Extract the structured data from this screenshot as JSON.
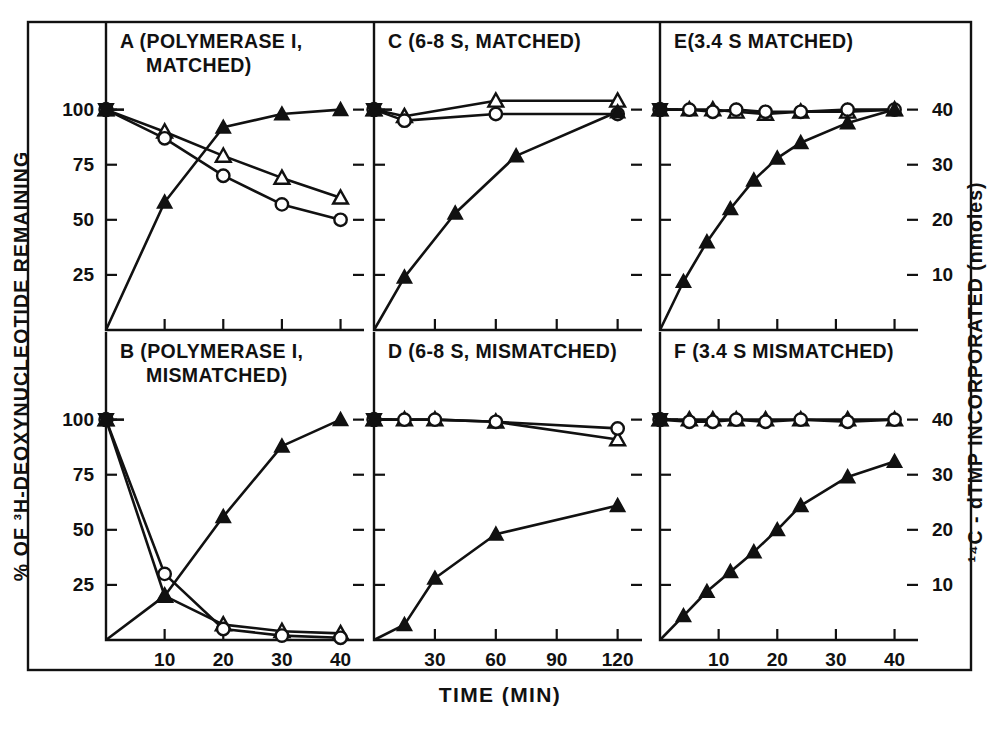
{
  "figure": {
    "xlabel": "TIME (MIN)",
    "ylabel_left": "% OF ³H-DEOXYNUCLEOTIDE REMAINING",
    "ylabel_right": "¹⁴C - dTMP INCORPORATED (nmoles)",
    "left_ticks": [
      "100",
      "75",
      "50",
      "25"
    ],
    "right_ticks": [
      "40",
      "30",
      "20",
      "10"
    ],
    "frame_color": "#111111",
    "background": "#ffffff"
  },
  "panels": [
    {
      "id": "A",
      "label": "A (POLYMERASE I,",
      "label_line2": "MATCHED)",
      "xticks": [
        "10",
        "20",
        "30",
        "40"
      ],
      "xtick_values": [
        10,
        20,
        30,
        40
      ],
      "xlim": [
        0,
        44
      ],
      "ylim_left": [
        0,
        108
      ],
      "row": "top",
      "col": 1
    },
    {
      "id": "B",
      "label": "B (POLYMERASE I,",
      "label_line2": "MISMATCHED)",
      "xticks": [
        "10",
        "20",
        "30",
        "40"
      ],
      "xtick_values": [
        10,
        20,
        30,
        40
      ],
      "xlim": [
        0,
        44
      ],
      "ylim_left": [
        0,
        108
      ],
      "row": "bottom",
      "col": 1
    },
    {
      "id": "C",
      "label": "C (6-8 S, MATCHED)",
      "label_line2": "",
      "xticks": [
        "30",
        "60",
        "90",
        "120"
      ],
      "xtick_values": [
        30,
        60,
        90,
        120
      ],
      "xlim": [
        0,
        132
      ],
      "ylim_left": [
        0,
        108
      ],
      "row": "top",
      "col": 2
    },
    {
      "id": "D",
      "label": "D (6-8 S, MISMATCHED)",
      "label_line2": "",
      "xticks": [
        "30",
        "60",
        "90",
        "120"
      ],
      "xtick_values": [
        30,
        60,
        90,
        120
      ],
      "xlim": [
        0,
        132
      ],
      "ylim_left": [
        0,
        108
      ],
      "row": "bottom",
      "col": 2
    },
    {
      "id": "E",
      "label": "E(3.4 S MATCHED)",
      "label_line2": "",
      "xticks": [
        "10",
        "20",
        "30",
        "40"
      ],
      "xtick_values": [
        10,
        20,
        30,
        40
      ],
      "xlim": [
        0,
        44
      ],
      "ylim_left": [
        0,
        108
      ],
      "row": "top",
      "col": 3
    },
    {
      "id": "F",
      "label": "F (3.4 S MISMATCHED)",
      "label_line2": "",
      "xticks": [
        "10",
        "20",
        "30",
        "40"
      ],
      "xtick_values": [
        10,
        20,
        30,
        40
      ],
      "xlim": [
        0,
        44
      ],
      "ylim_left": [
        0,
        108
      ],
      "row": "bottom",
      "col": 3
    }
  ],
  "chart_data": {
    "type": "line",
    "title": "",
    "xlabel": "TIME (MIN)",
    "ylabel": "% OF ³H-DEOXYNUCLEOTIDE REMAINING",
    "ylabel_secondary": "¹⁴C - dTMP INCORPORATED (nmoles)",
    "grid": false,
    "legend_position": "none",
    "marker_semantics": {
      "open-triangle": "³H-deoxynucleotide remaining (series 1)",
      "open-circle": "³H-deoxynucleotide remaining (series 2)",
      "filled-triangle": "¹⁴C-dTMP incorporated"
    },
    "panels": [
      {
        "id": "A",
        "title": "A (POLYMERASE I, MATCHED)",
        "xlim": [
          0,
          44
        ],
        "ylim_left": [
          0,
          108
        ],
        "ylim_right": [
          0,
          43.2
        ],
        "xticks": [
          10,
          20,
          30,
          40
        ],
        "left_yticks": [
          100,
          75,
          50,
          25
        ],
        "right_yticks": [
          40,
          30,
          20,
          10
        ],
        "series": [
          {
            "name": "open-triangle",
            "axis": "left",
            "x": [
              0,
              10,
              20,
              30,
              40
            ],
            "y": [
              100,
              90,
              79,
              69,
              60
            ]
          },
          {
            "name": "open-circle",
            "axis": "left",
            "x": [
              0,
              10,
              20,
              30,
              40
            ],
            "y": [
              100,
              87,
              70,
              57,
              50
            ]
          },
          {
            "name": "filled-triangle",
            "axis": "right",
            "x": [
              0,
              10,
              20,
              30,
              40
            ],
            "y": [
              0,
              23.2,
              36.8,
              39.2,
              40.0
            ]
          }
        ]
      },
      {
        "id": "B",
        "title": "B (POLYMERASE I, MISMATCHED)",
        "xlim": [
          0,
          44
        ],
        "ylim_left": [
          0,
          108
        ],
        "ylim_right": [
          0,
          43.2
        ],
        "xticks": [
          10,
          20,
          30,
          40
        ],
        "left_yticks": [
          100,
          75,
          50,
          25
        ],
        "right_yticks": [
          40,
          30,
          20,
          10
        ],
        "series": [
          {
            "name": "open-triangle",
            "axis": "left",
            "x": [
              0,
              10,
              20,
              30,
              40
            ],
            "y": [
              100,
              20,
              7,
              4,
              3
            ]
          },
          {
            "name": "open-circle",
            "axis": "left",
            "x": [
              0,
              10,
              20,
              30,
              40
            ],
            "y": [
              100,
              30,
              5,
              2,
              1
            ]
          },
          {
            "name": "filled-triangle",
            "axis": "right",
            "x": [
              0,
              10,
              20,
              30,
              40
            ],
            "y": [
              0,
              8.0,
              22.4,
              35.2,
              40.0
            ]
          }
        ]
      },
      {
        "id": "C",
        "title": "C (6-8 S, MATCHED)",
        "xlim": [
          0,
          132
        ],
        "ylim_left": [
          0,
          108
        ],
        "ylim_right": [
          0,
          43.2
        ],
        "xticks": [
          30,
          60,
          90,
          120
        ],
        "left_yticks": [
          100,
          75,
          50,
          25
        ],
        "right_yticks": [
          40,
          30,
          20,
          10
        ],
        "series": [
          {
            "name": "open-triangle",
            "axis": "left",
            "x": [
              0,
              15,
              60,
              120
            ],
            "y": [
              100,
              97,
              104,
              104
            ]
          },
          {
            "name": "open-circle",
            "axis": "left",
            "x": [
              0,
              15,
              60,
              120
            ],
            "y": [
              100,
              95,
              98,
              98
            ]
          },
          {
            "name": "filled-triangle",
            "axis": "right",
            "x": [
              0,
              15,
              40,
              70,
              120
            ],
            "y": [
              0,
              9.6,
              21.2,
              31.6,
              39.6
            ]
          }
        ]
      },
      {
        "id": "D",
        "title": "D (6-8 S, MISMATCHED)",
        "xlim": [
          0,
          132
        ],
        "ylim_left": [
          0,
          108
        ],
        "ylim_right": [
          0,
          43.2
        ],
        "xticks": [
          30,
          60,
          90,
          120
        ],
        "left_yticks": [
          100,
          75,
          50,
          25
        ],
        "right_yticks": [
          40,
          30,
          20,
          10
        ],
        "series": [
          {
            "name": "open-triangle",
            "axis": "left",
            "x": [
              0,
              15,
              30,
              60,
              120
            ],
            "y": [
              100,
              100,
              100,
              99,
              91
            ]
          },
          {
            "name": "open-circle",
            "axis": "left",
            "x": [
              0,
              15,
              30,
              60,
              120
            ],
            "y": [
              100,
              100,
              100,
              99,
              96
            ]
          },
          {
            "name": "filled-triangle",
            "axis": "right",
            "x": [
              0,
              15,
              30,
              60,
              120
            ],
            "y": [
              0,
              2.8,
              11.2,
              19.2,
              24.4
            ]
          }
        ]
      },
      {
        "id": "E",
        "title": "E (3.4 S MATCHED)",
        "xlim": [
          0,
          44
        ],
        "ylim_left": [
          0,
          108
        ],
        "ylim_right": [
          0,
          43.2
        ],
        "xticks": [
          10,
          20,
          30,
          40
        ],
        "left_yticks": [
          100,
          75,
          50,
          25
        ],
        "right_yticks": [
          40,
          30,
          20,
          10
        ],
        "series": [
          {
            "name": "open-triangle",
            "axis": "left",
            "x": [
              0,
              5,
              9,
              13,
              18,
              24,
              32,
              40
            ],
            "y": [
              100,
              100,
              100,
              99,
              98,
              99,
              99,
              100
            ]
          },
          {
            "name": "open-circle",
            "axis": "left",
            "x": [
              0,
              5,
              9,
              13,
              18,
              24,
              32,
              40
            ],
            "y": [
              100,
              100,
              99,
              100,
              99,
              99,
              100,
              100
            ]
          },
          {
            "name": "filled-triangle",
            "axis": "right",
            "x": [
              0,
              4,
              8,
              12,
              16,
              20,
              24,
              32,
              40
            ],
            "y": [
              0,
              8.8,
              16.0,
              22.0,
              27.2,
              31.2,
              34.0,
              37.6,
              40.0
            ]
          }
        ]
      },
      {
        "id": "F",
        "title": "F (3.4 S MISMATCHED)",
        "xlim": [
          0,
          44
        ],
        "ylim_left": [
          0,
          108
        ],
        "ylim_right": [
          0,
          43.2
        ],
        "xticks": [
          10,
          20,
          30,
          40
        ],
        "left_yticks": [
          100,
          75,
          50,
          25
        ],
        "right_yticks": [
          40,
          30,
          20,
          10
        ],
        "series": [
          {
            "name": "open-triangle",
            "axis": "left",
            "x": [
              0,
              5,
              9,
              13,
              18,
              24,
              32,
              40
            ],
            "y": [
              100,
              100,
              100,
              100,
              100,
              100,
              100,
              100
            ]
          },
          {
            "name": "open-circle",
            "axis": "left",
            "x": [
              0,
              5,
              9,
              13,
              18,
              24,
              32,
              40
            ],
            "y": [
              100,
              99,
              99,
              100,
              99,
              100,
              99,
              100
            ]
          },
          {
            "name": "filled-triangle",
            "axis": "right",
            "x": [
              0,
              4,
              8,
              12,
              16,
              20,
              24,
              32,
              40
            ],
            "y": [
              0,
              4.4,
              8.8,
              12.4,
              16.0,
              20.0,
              24.4,
              29.6,
              32.4
            ]
          }
        ]
      }
    ]
  }
}
